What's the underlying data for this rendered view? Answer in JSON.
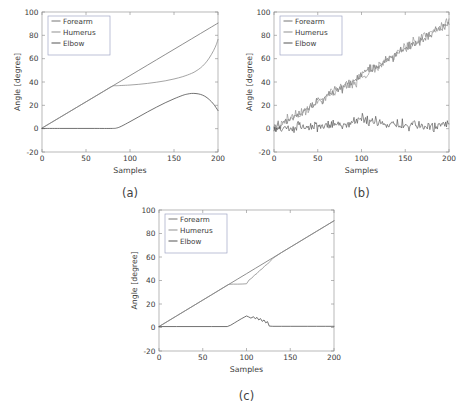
{
  "figure": {
    "background": "#ffffff",
    "axis_color": "#9a9a9a",
    "grid_color": "#d9d9e2",
    "bottom_caption": ""
  },
  "chart_data": [
    {
      "id": "a",
      "type": "line",
      "subplot_label": "(a)",
      "title": "",
      "xlabel": "Samples",
      "ylabel": "Angle [degree]",
      "xlim": [
        0,
        200
      ],
      "ylim": [
        -20,
        100
      ],
      "xticks": [
        0,
        50,
        100,
        150,
        200
      ],
      "yticks": [
        -20,
        0,
        20,
        40,
        60,
        80,
        100
      ],
      "grid": true,
      "legend": [
        "Forearm",
        "Humerus",
        "Elbow"
      ],
      "legend_position": "top-left",
      "series": [
        {
          "name": "Forearm",
          "color": "#6f6f6f",
          "x": [
            0,
            10,
            20,
            30,
            40,
            50,
            60,
            70,
            80,
            90,
            100,
            110,
            120,
            130,
            140,
            150,
            160,
            170,
            180,
            190,
            200
          ],
          "values": [
            0.5,
            5.0,
            9.5,
            14.0,
            18.5,
            23.0,
            27.5,
            32.0,
            36.5,
            41.0,
            45.5,
            50.0,
            54.5,
            59.0,
            63.5,
            68.0,
            72.5,
            77.0,
            81.5,
            86.0,
            90.5
          ]
        },
        {
          "name": "Humerus",
          "color": "#8a8a8a",
          "x": [
            0,
            10,
            20,
            30,
            40,
            50,
            60,
            70,
            80,
            85,
            90,
            100,
            110,
            120,
            130,
            140,
            150,
            160,
            170,
            175,
            180,
            185,
            190,
            195,
            198,
            200
          ],
          "values": [
            0.5,
            5.0,
            9.5,
            14.0,
            18.5,
            23.0,
            27.5,
            32.0,
            36.4,
            36.8,
            37.0,
            37.4,
            38.0,
            38.8,
            39.8,
            41.0,
            42.6,
            44.6,
            47.4,
            49.4,
            52.0,
            55.6,
            60.5,
            67.0,
            72.0,
            76.5
          ]
        },
        {
          "name": "Elbow",
          "color": "#4a4a4a",
          "x": [
            0,
            20,
            40,
            60,
            80,
            85,
            90,
            100,
            110,
            120,
            130,
            140,
            150,
            160,
            165,
            170,
            175,
            180,
            185,
            190,
            195,
            200
          ],
          "values": [
            0.2,
            0.2,
            0.2,
            0.2,
            0.2,
            0.6,
            2.0,
            6.0,
            10.2,
            14.4,
            18.4,
            22.2,
            25.6,
            28.6,
            29.6,
            30.2,
            30.1,
            29.4,
            27.8,
            25.0,
            21.0,
            15.5
          ]
        }
      ]
    },
    {
      "id": "b",
      "type": "line",
      "subplot_label": "(b)",
      "title": "",
      "xlabel": "Samples",
      "ylabel": "Angle [degree]",
      "xlim": [
        0,
        200
      ],
      "ylim": [
        -20,
        100
      ],
      "xticks": [
        0,
        50,
        100,
        150,
        200
      ],
      "yticks": [
        -20,
        0,
        20,
        40,
        60,
        80,
        100
      ],
      "grid": true,
      "legend": [
        "Forearm",
        "Humerus",
        "Elbow"
      ],
      "legend_position": "top-left",
      "noise_description": "noisy versions of subplot (a) signals",
      "series": [
        {
          "name": "Forearm",
          "color": "#6f6f6f",
          "noise_amplitude": 4.0,
          "x": [
            0,
            10,
            20,
            30,
            40,
            50,
            60,
            70,
            80,
            90,
            100,
            110,
            120,
            130,
            140,
            150,
            160,
            170,
            180,
            190,
            200
          ],
          "values": [
            0.5,
            5.0,
            9.5,
            14.0,
            18.5,
            23.0,
            27.5,
            32.0,
            36.5,
            41.0,
            45.5,
            50.0,
            54.5,
            59.0,
            63.5,
            68.0,
            72.5,
            77.0,
            81.5,
            86.0,
            90.5
          ]
        },
        {
          "name": "Humerus",
          "color": "#8a8a8a",
          "noise_amplitude": 4.5,
          "x": [
            0,
            10,
            20,
            30,
            40,
            50,
            60,
            70,
            80,
            85,
            90,
            100,
            110,
            120,
            130,
            140,
            150,
            160,
            170,
            180,
            190,
            200
          ],
          "values": [
            0.5,
            5.0,
            9.5,
            14.0,
            18.5,
            23.0,
            27.5,
            32.0,
            36.4,
            36.8,
            38.0,
            44.0,
            49.0,
            54.0,
            59.0,
            64.0,
            69.0,
            74.0,
            79.0,
            84.0,
            88.0,
            92.0
          ]
        },
        {
          "name": "Elbow",
          "color": "#4a4a4a",
          "noise_amplitude": 4.5,
          "x": [
            0,
            20,
            40,
            60,
            80,
            90,
            100,
            110,
            120,
            130,
            140,
            150,
            160,
            170,
            180,
            190,
            200
          ],
          "values": [
            0.5,
            1.0,
            1.5,
            2.0,
            3.0,
            6.0,
            9.0,
            7.0,
            5.0,
            4.0,
            3.5,
            3.0,
            3.0,
            2.5,
            2.0,
            2.0,
            3.0
          ]
        }
      ]
    },
    {
      "id": "c",
      "type": "line",
      "subplot_label": "(c)",
      "title": "",
      "xlabel": "Samples",
      "ylabel": "Angle [degree]",
      "xlim": [
        0,
        200
      ],
      "ylim": [
        -20,
        100
      ],
      "xticks": [
        0,
        50,
        100,
        150,
        200
      ],
      "yticks": [
        -20,
        0,
        20,
        40,
        60,
        80,
        100
      ],
      "grid": true,
      "legend": [
        "Forearm",
        "Humerus",
        "Elbow"
      ],
      "legend_position": "top-left",
      "series": [
        {
          "name": "Forearm",
          "color": "#6f6f6f",
          "x": [
            0,
            10,
            20,
            30,
            40,
            50,
            60,
            70,
            80,
            90,
            100,
            110,
            120,
            130,
            140,
            150,
            160,
            170,
            180,
            190,
            200
          ],
          "values": [
            0.8,
            5.3,
            9.8,
            14.3,
            18.8,
            23.3,
            27.8,
            32.3,
            36.8,
            41.3,
            45.8,
            50.3,
            54.8,
            59.3,
            63.8,
            68.3,
            72.8,
            77.3,
            81.8,
            86.3,
            90.8
          ]
        },
        {
          "name": "Humerus",
          "color": "#8a8a8a",
          "x": [
            0,
            20,
            40,
            60,
            78,
            80,
            85,
            90,
            95,
            100,
            103,
            106,
            109,
            112,
            115,
            118,
            121,
            124,
            127,
            130,
            140,
            150,
            160,
            170,
            180,
            190,
            200
          ],
          "values": [
            0.8,
            9.8,
            18.8,
            27.8,
            36.0,
            36.8,
            36.9,
            36.9,
            37.0,
            37.2,
            40.5,
            42.0,
            44.5,
            46.0,
            48.5,
            50.0,
            52.5,
            54.0,
            56.3,
            58.8,
            63.8,
            68.3,
            72.8,
            77.3,
            81.8,
            86.3,
            90.8
          ]
        },
        {
          "name": "Elbow",
          "color": "#4a4a4a",
          "x": [
            0,
            20,
            40,
            60,
            78,
            82,
            86,
            90,
            94,
            98,
            100,
            102,
            105,
            108,
            110,
            112,
            114,
            116,
            118,
            120,
            122,
            124,
            126,
            130,
            140,
            150,
            160,
            170,
            180,
            190,
            200
          ],
          "values": [
            0.8,
            0.8,
            0.8,
            0.8,
            0.8,
            2.0,
            3.8,
            5.6,
            7.4,
            9.0,
            9.8,
            9.2,
            8.0,
            9.2,
            7.4,
            8.6,
            6.4,
            7.6,
            5.2,
            6.4,
            4.0,
            5.0,
            1.2,
            1.0,
            1.0,
            1.0,
            1.0,
            1.0,
            1.0,
            1.0,
            1.0
          ]
        }
      ]
    }
  ]
}
